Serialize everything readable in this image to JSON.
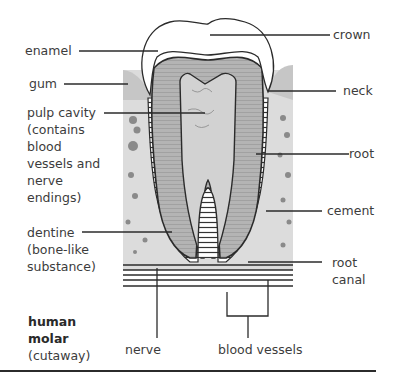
{
  "diagram": {
    "title_line1": "human",
    "title_line2": "molar",
    "subtitle": "(cutaway)",
    "labels": {
      "enamel": "enamel",
      "gum": "gum",
      "pulp_cavity": "pulp cavity\n(contains\nblood\nvessels and\nnerve\nendings)",
      "dentine": "dentine\n(bone-like\nsubstance)",
      "crown": "crown",
      "neck": "neck",
      "root": "root",
      "cement": "cement",
      "root_canal": "root\ncanal",
      "nerve": "nerve",
      "blood_vessels": "blood vessels"
    },
    "colors": {
      "line": "#2b2b2b",
      "dentine": "#a9a9a9",
      "pulp": "#d2d2d2",
      "enamel": "#ffffff",
      "gum": "#c8c8c8",
      "bone": "#dedede"
    }
  }
}
